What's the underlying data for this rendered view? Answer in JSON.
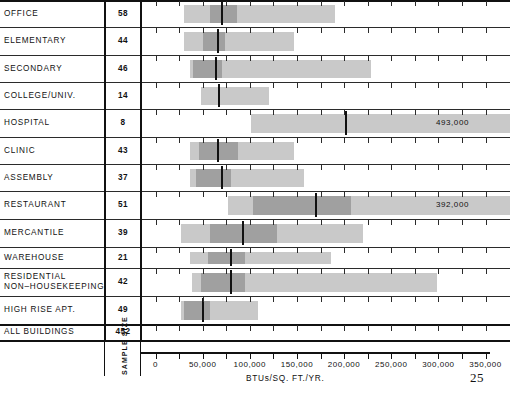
{
  "chart_data": {
    "type": "bar",
    "title": "",
    "xlabel": "BTUs/SQ. FT./YR.",
    "ylabel": "",
    "xlim": [
      0,
      360000
    ],
    "grid": false,
    "legend": null,
    "x_ticks": [
      0,
      25000,
      50000,
      75000,
      100000,
      125000,
      150000,
      175000,
      200000,
      225000,
      250000,
      275000,
      300000,
      325000,
      350000
    ],
    "x_tick_labels": [
      {
        "value": 0,
        "label": "0"
      },
      {
        "value": 50000,
        "label": "50,000"
      },
      {
        "value": 100000,
        "label": "100,000"
      },
      {
        "value": 150000,
        "label": "150,000"
      },
      {
        "value": 200000,
        "label": "200,000"
      },
      {
        "value": 250000,
        "label": "250,000"
      },
      {
        "value": 300000,
        "label": "300,000"
      },
      {
        "value": 350000,
        "label": "350,000"
      }
    ],
    "columns": [
      "BUILDING TYPE",
      "SAMPLE SIZE"
    ],
    "sample_size_caption": "SAMPLE SIZE",
    "categories": [
      {
        "label": "OFFICE",
        "sample_size": "58",
        "range_low": 30000,
        "range_high": 190000,
        "box_low": 58000,
        "box_high": 86000,
        "median": 71000,
        "overflow_label": null
      },
      {
        "label": "ELEMENTARY",
        "sample_size": "44",
        "range_low": 30000,
        "range_high": 147000,
        "box_low": 50000,
        "box_high": 74000,
        "median": 66000,
        "overflow_label": null
      },
      {
        "label": "SECONDARY",
        "sample_size": "46",
        "range_low": 37000,
        "range_high": 229000,
        "box_low": 40000,
        "box_high": 71000,
        "median": 64000,
        "overflow_label": null
      },
      {
        "label": "COLLEGE/UNIV.",
        "sample_size": "14",
        "range_low": 48000,
        "range_high": 120000,
        "box_low": null,
        "box_high": null,
        "median": 67000,
        "overflow_label": null
      },
      {
        "label": "HOSPITAL",
        "sample_size": "8",
        "range_low": 101000,
        "range_high": 493000,
        "box_low": null,
        "box_high": null,
        "median": 202000,
        "overflow_label": "493,000"
      },
      {
        "label": "CLINIC",
        "sample_size": "43",
        "range_low": 37000,
        "range_high": 147000,
        "box_low": 46000,
        "box_high": 87000,
        "median": 66000,
        "overflow_label": null
      },
      {
        "label": "ASSEMBLY",
        "sample_size": "37",
        "range_low": 37000,
        "range_high": 157000,
        "box_low": 43000,
        "box_high": 80000,
        "median": 71000,
        "overflow_label": null
      },
      {
        "label": "RESTAURANT",
        "sample_size": "51",
        "range_low": 77000,
        "range_high": 392000,
        "box_low": 103000,
        "box_high": 207000,
        "median": 170000,
        "overflow_label": "392,000"
      },
      {
        "label": "MERCANTILE",
        "sample_size": "39",
        "range_low": 27000,
        "range_high": 220000,
        "box_low": 58000,
        "box_high": 129000,
        "median": 93000,
        "overflow_label": null
      },
      {
        "label": "WAREHOUSE",
        "sample_size": "21",
        "range_low": 37000,
        "range_high": 186000,
        "box_low": 56000,
        "box_high": 95000,
        "median": 80000,
        "overflow_label": null
      },
      {
        "label": "RESIDENTIAL NON–HOUSEKEEPING",
        "label_line1": "RESIDENTIAL",
        "label_line2": "NON–HOUSEKEEPING",
        "sample_size": "42",
        "range_low": 39000,
        "range_high": 299000,
        "box_low": 48000,
        "box_high": 95000,
        "median": 80000,
        "overflow_label": null
      },
      {
        "label": "HIGH RISE APT.",
        "sample_size": "49",
        "range_low": 27000,
        "range_high": 109000,
        "box_low": 30000,
        "box_high": 58000,
        "median": 50000,
        "overflow_label": null
      },
      {
        "label": "ALL BUILDINGS",
        "sample_size": "452",
        "range_low": null,
        "range_high": null,
        "box_low": null,
        "box_high": null,
        "median": null,
        "overflow_label": null
      }
    ]
  },
  "page": {
    "number": "25"
  },
  "colors": {
    "range_band": "#c9c9c9",
    "box_band": "#a0a0a0",
    "median_line": "#111111",
    "rule": "#2b2b2b",
    "background": "#ffffff"
  }
}
